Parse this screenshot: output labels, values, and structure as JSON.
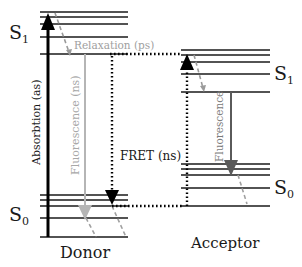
{
  "diagram": {
    "type": "jablonski-fret",
    "donor": {
      "label": "Donor",
      "s1_label": "S",
      "s1_sub": "1",
      "s0_label": "S",
      "s0_sub": "0"
    },
    "acceptor": {
      "label": "Acceptor",
      "s1_label": "S",
      "s1_sub": "1",
      "s0_label": "S",
      "s0_sub": "0"
    },
    "processes": {
      "absorption": "Absorbtion (as)",
      "relaxation": "Relaxation (ps)",
      "donor_fluorescence": "Fluorescence (ns)",
      "fret": "FRET (ns)",
      "acceptor_fluorescence": "Fluorescence"
    },
    "colors": {
      "level_line": "#1a1a1a",
      "absorption_arrow": "#000000",
      "donor_fluorescence": "#b5b5b5",
      "acceptor_fluorescence": "#5a5a5a",
      "relaxation_dashed": "#9a9a9a",
      "relaxation_text": "#a0a0a0",
      "fret_dotted": "#000000"
    }
  }
}
